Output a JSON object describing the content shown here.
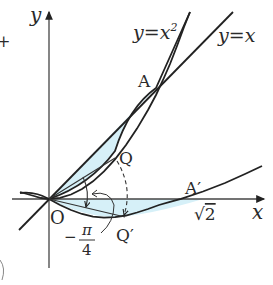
{
  "diagram": {
    "type": "coordinate-geometry",
    "axes": {
      "x_label": "x",
      "y_label": "y",
      "origin_label": "O"
    },
    "curves": [
      {
        "id": "parabola",
        "label": "y=x",
        "label_sup": "2"
      },
      {
        "id": "line",
        "label": "y=x"
      },
      {
        "id": "rotated-parabola",
        "label": ""
      }
    ],
    "points": {
      "A": "A",
      "A_prime": "A′",
      "Q": "Q",
      "Q_prime": "Q′"
    },
    "annotations": {
      "rotation_angle_sign": "−",
      "rotation_angle_num": "π",
      "rotation_angle_den": "4",
      "sqrt2_radical": "√",
      "sqrt2_value": "2"
    },
    "colors": {
      "stroke": "#222222",
      "shade": "#d6f0f8"
    }
  }
}
